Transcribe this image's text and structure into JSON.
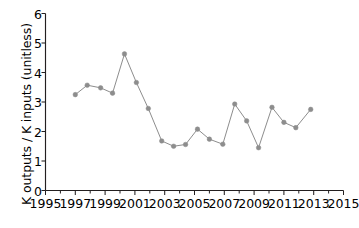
{
  "chart_data": {
    "type": "line",
    "title": "",
    "subtitle": "",
    "xlabel": "",
    "ylabel": "K outputs / K inputs (unitless)",
    "xlim": [
      1995,
      2015
    ],
    "ylim": [
      0,
      6
    ],
    "x_tick_labels": [
      "1995",
      "1997",
      "1999",
      "2001",
      "2003",
      "2005",
      "2007",
      "2009",
      "2011",
      "2013",
      "2015"
    ],
    "x_tick_values": [
      1995,
      1997,
      1999,
      2001,
      2003,
      2005,
      2007,
      2009,
      2011,
      2013,
      2015
    ],
    "x_minor_tick_values": [
      1996,
      1998,
      2000,
      2002,
      2004,
      2006,
      2008,
      2010,
      2012,
      2014
    ],
    "y_tick_labels": [
      "0",
      "1",
      "2",
      "3",
      "4",
      "5",
      "6"
    ],
    "y_tick_values": [
      0,
      1,
      2,
      3,
      4,
      5,
      6
    ],
    "grid": false,
    "legend": null,
    "series_color": "#8d8d8d",
    "axis_color": "#231f20",
    "marker": "circle",
    "x": [
      1997,
      1998,
      1999,
      2000,
      2001,
      2002,
      2003,
      2004,
      2005,
      2006,
      2007,
      2008,
      2009,
      2010,
      2011,
      2012,
      2013,
      2014
    ],
    "series": [
      {
        "name": "K outputs / K inputs",
        "values": [
          3.25,
          3.57,
          3.48,
          3.3,
          4.63,
          3.66,
          2.78,
          1.68,
          1.5,
          1.56,
          2.08,
          1.74,
          1.57,
          2.93,
          2.36,
          1.45,
          2.82,
          2.31
        ]
      }
    ],
    "points": [
      {
        "year": 1997,
        "value": 3.25
      },
      {
        "year": 1998,
        "value": 3.57
      },
      {
        "year": 1999,
        "value": 3.48
      },
      {
        "year": 2000,
        "value": 3.3
      },
      {
        "year": 2000.5,
        "value": 4.63
      },
      {
        "year": 2001,
        "value": 3.66
      },
      {
        "year": 2002,
        "value": 2.78
      },
      {
        "year": 2003,
        "value": 1.68
      },
      {
        "year": 2004,
        "value": 1.5
      },
      {
        "year": 2005,
        "value": 1.56
      },
      {
        "year": 2006,
        "value": 2.08
      },
      {
        "year": 2007,
        "value": 1.74
      },
      {
        "year": 2008,
        "value": 1.57
      },
      {
        "year": 2009,
        "value": 2.93
      },
      {
        "year": 2010,
        "value": 2.36
      },
      {
        "year": 2011,
        "value": 1.45
      },
      {
        "year": 2012,
        "value": 2.82
      },
      {
        "year": 2013,
        "value": 2.31
      },
      {
        "year": 2014,
        "value": 2.13
      },
      {
        "year": 2015,
        "value": 2.75
      }
    ],
    "plotted_x": [
      1997,
      1997.8,
      1998.7,
      1999.5,
      2000.3,
      2001.1,
      2001.9,
      2002.8,
      2003.6,
      2004.4,
      2005.2,
      2006.0,
      2006.9,
      2007.7,
      2008.5,
      2009.3,
      2010.2,
      2011.0,
      2011.8,
      2012.8
    ],
    "plotted_y": [
      3.25,
      3.57,
      3.48,
      3.3,
      4.63,
      3.66,
      2.78,
      1.68,
      1.5,
      1.56,
      2.08,
      1.74,
      1.57,
      2.93,
      2.36,
      1.45,
      2.82,
      2.31,
      2.13,
      2.75
    ]
  }
}
